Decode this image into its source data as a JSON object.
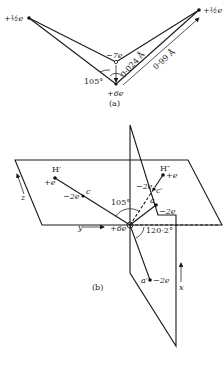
{
  "figure": {
    "part_a": {
      "caption": "(a)",
      "labels": {
        "h_left_charge": "+½e",
        "h_right_charge": "+½e",
        "m_charge": "−7e",
        "o_charge": "+6e",
        "angle": "105°",
        "om_distance": "0·024 Å",
        "oh_distance": "0·99 Å"
      }
    },
    "part_b": {
      "caption": "(b)",
      "labels": {
        "h1_name": "H′",
        "h1_charge": "+e",
        "h2_name": "H″",
        "h2_charge": "+e",
        "c1_name": "c",
        "c1_charge": "−2e",
        "c2_name": "c′",
        "c2_charge": "−2e",
        "a_name": "a",
        "a_charge": "−2e",
        "a2_name": "a′",
        "a2_charge": "−2e",
        "o_charge": "+6e",
        "angle_hoh": "105°",
        "angle_tet": "120·2°",
        "axis_x": "x",
        "axis_y": "y",
        "axis_z": "z"
      }
    }
  }
}
